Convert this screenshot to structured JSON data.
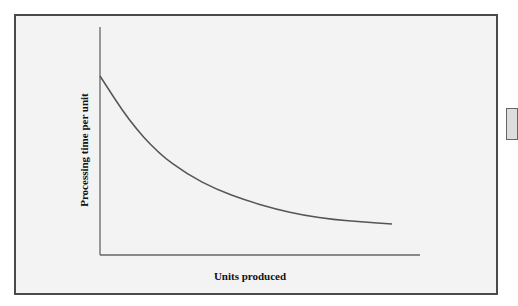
{
  "chart_data": {
    "type": "line",
    "title": "",
    "xlabel": "Units produced",
    "ylabel": "Processing time per unit",
    "grid": false,
    "legend": null,
    "x_ticks": [],
    "y_ticks": [],
    "series": [
      {
        "name": "Processing time per unit",
        "description": "Decreasing convex curve (learning curve), steep at start, flattening out",
        "x": [
          0,
          0.1,
          0.2,
          0.3,
          0.4,
          0.5,
          0.6,
          0.7,
          0.8,
          0.9,
          1.0
        ],
        "values": [
          0.85,
          0.64,
          0.49,
          0.39,
          0.32,
          0.27,
          0.23,
          0.2,
          0.18,
          0.17,
          0.16
        ]
      }
    ],
    "xlim": [
      0,
      1.1
    ],
    "ylim": [
      0,
      1
    ]
  },
  "colors": {
    "frame_border": "#4a4a4a",
    "frame_fill": "#f3f3f3",
    "axis": "#666666",
    "curve": "#555555"
  }
}
